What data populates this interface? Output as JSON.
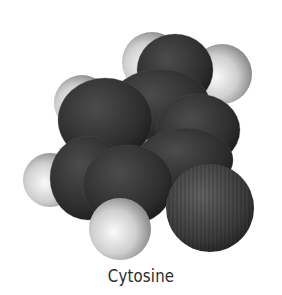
{
  "caption": "Cytosine",
  "molecule": {
    "name": "Cytosine",
    "colors": {
      "hydrogen_light": "#f2f2f2",
      "hydrogen_dark": "#8a8a8a",
      "carbon_light": "#4a4a4a",
      "carbon_dark": "#1c1c1c",
      "oxygen_light": "#5e5e5e",
      "oxygen_dark": "#262626"
    },
    "hydrogens": [
      {
        "cx": 152,
        "cy": 62,
        "r": 30
      },
      {
        "cx": 222,
        "cy": 74,
        "r": 30
      },
      {
        "cx": 82,
        "cy": 103,
        "r": 28
      },
      {
        "cx": 50,
        "cy": 180,
        "r": 27
      },
      {
        "cx": 120,
        "cy": 229,
        "r": 31
      }
    ],
    "heavy_atoms": [
      {
        "type": "carbon",
        "cx": 175,
        "cy": 70,
        "rx": 38,
        "ry": 36
      },
      {
        "type": "carbon",
        "cx": 160,
        "cy": 105,
        "rx": 50,
        "ry": 36
      },
      {
        "type": "carbon",
        "cx": 105,
        "cy": 120,
        "rx": 47,
        "ry": 42
      },
      {
        "type": "carbon",
        "cx": 198,
        "cy": 130,
        "rx": 42,
        "ry": 36
      },
      {
        "type": "carbon",
        "cx": 88,
        "cy": 178,
        "rx": 38,
        "ry": 42
      },
      {
        "type": "carbon",
        "cx": 185,
        "cy": 160,
        "rx": 48,
        "ry": 32
      },
      {
        "type": "carbon",
        "cx": 128,
        "cy": 185,
        "rx": 45,
        "ry": 40
      }
    ],
    "oxygen": {
      "cx": 210,
      "cy": 208,
      "r": 44
    }
  }
}
